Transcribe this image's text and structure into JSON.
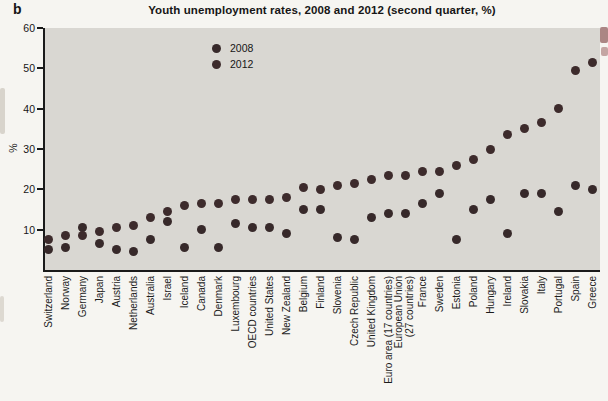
{
  "panel_label": "b",
  "title": "Youth unemployment rates, 2008 and 2012 (second quarter, %)",
  "legend": {
    "series": [
      {
        "label": "2008"
      },
      {
        "label": "2012"
      }
    ]
  },
  "colors": {
    "dot_2008": "#37292a",
    "dot_2012": "#3d2b2c",
    "plot_background": "#d9d7d2",
    "page_background": "#f6f5f1",
    "axis": "#1a1a1a"
  },
  "chart_data": {
    "type": "scatter",
    "title": "Youth unemployment rates, 2008 and 2012 (second quarter, %)",
    "xlabel": "",
    "ylabel": "%",
    "ylim": [
      0,
      60
    ],
    "yticks": [
      10,
      20,
      30,
      40,
      50,
      60
    ],
    "grid": false,
    "legend_position": "inside-top-left",
    "categories": [
      "Switzerland",
      "Norway",
      "Germany",
      "Japan",
      "Austria",
      "Netherlands",
      "Australia",
      "Israel",
      "Iceland",
      "Canada",
      "Denmark",
      "Luxembourg",
      "OECD countries",
      "United States",
      "New Zealand",
      "Belgium",
      "Finland",
      "Slovenia",
      "Czech Republic",
      "United Kingdom",
      "Euro area (17 countries)",
      "European Union\n(27 countries)",
      "France",
      "Sweden",
      "Estonia",
      "Poland",
      "Hungary",
      "Ireland",
      "Slovakia",
      "Italy",
      "Portugal",
      "Spain",
      "Greece"
    ],
    "series": [
      {
        "name": "2008",
        "values": [
          5,
          5.5,
          10.5,
          6.5,
          5,
          4.5,
          7.5,
          12,
          5.5,
          10,
          5.5,
          11.5,
          10.5,
          10.5,
          9,
          15,
          15,
          8,
          7.5,
          13,
          14,
          14,
          16.5,
          19,
          7.5,
          15,
          17.5,
          9,
          19,
          19,
          14.5,
          21,
          20
        ]
      },
      {
        "name": "2012",
        "values": [
          7.5,
          8.5,
          8.5,
          9.5,
          10.5,
          11,
          13,
          14.5,
          16,
          16.5,
          16.5,
          17.5,
          17.5,
          17.5,
          18,
          20.5,
          20,
          21,
          21.5,
          22.5,
          23.5,
          23.5,
          24.5,
          24.5,
          26,
          27.5,
          30,
          33.5,
          35,
          36.5,
          40,
          49.5,
          51.5
        ]
      }
    ]
  }
}
